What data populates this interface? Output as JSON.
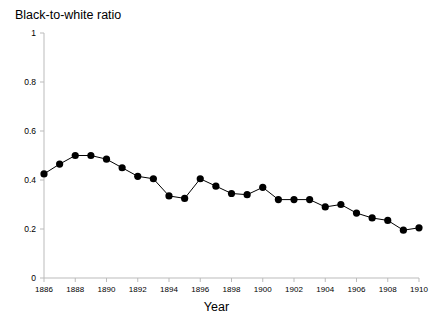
{
  "chart_data": {
    "type": "line",
    "title": "Black-to-white ratio",
    "xlabel": "Year",
    "ylabel": "",
    "xlim": [
      1886,
      1910
    ],
    "ylim": [
      0,
      1
    ],
    "grid": false,
    "legend": "none",
    "marker": "filled-circle",
    "line_color": "#000000",
    "marker_color": "#000000",
    "axis_color": "#bbbbbb",
    "xticks": [
      1886,
      1888,
      1890,
      1892,
      1894,
      1896,
      1898,
      1900,
      1902,
      1904,
      1906,
      1908,
      1910
    ],
    "xtick_labels": [
      "1886",
      "1888",
      "1890",
      "1892",
      "1894",
      "1896",
      "1898",
      "1900",
      "1902",
      "1904",
      "1906",
      "1908",
      "1910"
    ],
    "yticks": [
      0,
      0.2,
      0.4,
      0.6,
      0.8,
      1
    ],
    "ytick_labels": [
      "0",
      "0.2",
      "0.4",
      "0.6",
      "0.8",
      "1"
    ],
    "x": [
      1886,
      1887,
      1888,
      1889,
      1890,
      1891,
      1892,
      1893,
      1894,
      1895,
      1896,
      1897,
      1898,
      1899,
      1900,
      1901,
      1902,
      1903,
      1904,
      1905,
      1906,
      1907,
      1908,
      1909,
      1910
    ],
    "values": [
      0.425,
      0.465,
      0.5,
      0.5,
      0.485,
      0.45,
      0.415,
      0.405,
      0.335,
      0.325,
      0.405,
      0.375,
      0.345,
      0.34,
      0.37,
      0.32,
      0.32,
      0.32,
      0.29,
      0.3,
      0.265,
      0.245,
      0.235,
      0.195,
      0.205
    ],
    "series_name": "Black-to-white ratio"
  }
}
